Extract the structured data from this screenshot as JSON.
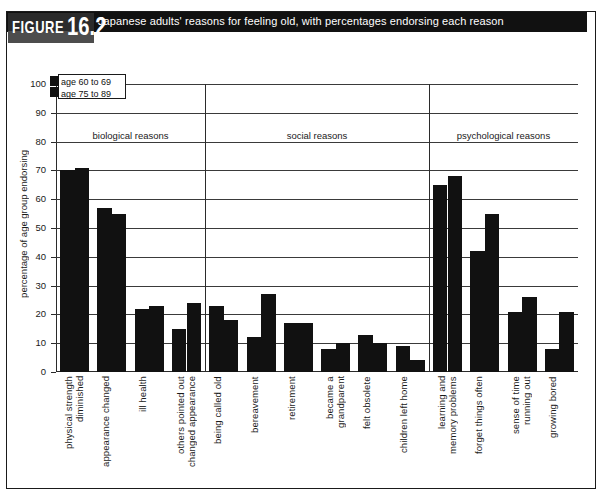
{
  "figure": {
    "tag_word": "FIGURE",
    "number": "16.2",
    "caption": "Japanese adults' reasons for feeling old, with percentages endorsing each reason"
  },
  "legend": {
    "series": [
      {
        "label": "age 60 to 69",
        "color": "#111111"
      },
      {
        "label": "age 75 to 89",
        "color": "#111111"
      }
    ]
  },
  "axes": {
    "y_title": "percentage of age group endorsing",
    "y_ticks": [
      "0",
      "10",
      "20",
      "30",
      "40",
      "50",
      "60",
      "70",
      "80",
      "90",
      "100"
    ]
  },
  "groups": [
    {
      "id": "biological",
      "label": "biological reasons"
    },
    {
      "id": "social",
      "label": "social reasons"
    },
    {
      "id": "psychological",
      "label": "psychological reasons"
    }
  ],
  "chart_data": {
    "type": "bar",
    "title": "Japanese adults' reasons for feeling old, with percentages endorsing each reason",
    "xlabel": "",
    "ylabel": "percentage of age group endorsing",
    "ylim": [
      0,
      100
    ],
    "ytick_step": 10,
    "grid": true,
    "legend_position": "top-left",
    "group_labels": [
      "biological reasons",
      "social reasons",
      "psychological reasons"
    ],
    "categories": [
      "physical strength\ndiminished",
      "appearance changed",
      "ill health",
      "others pointed out\nchanged appearance",
      "being called old",
      "bereavement",
      "retirement",
      "became a\ngrandparent",
      "felt obsolete",
      "children left home",
      "learning and\nmemory problems",
      "forget things often",
      "sense of time\nrunning out",
      "growing bored"
    ],
    "category_groups": [
      "biological",
      "biological",
      "biological",
      "biological",
      "social",
      "social",
      "social",
      "social",
      "social",
      "social",
      "psychological",
      "psychological",
      "psychological",
      "psychological"
    ],
    "series": [
      {
        "name": "age 60 to 69",
        "values": [
          70,
          57,
          22,
          15,
          23,
          12,
          17,
          8,
          13,
          9,
          65,
          42,
          21,
          8
        ]
      },
      {
        "name": "age 75 to 89",
        "values": [
          71,
          55,
          23,
          24,
          18,
          27,
          17,
          10,
          10,
          4,
          68,
          55,
          26,
          21
        ]
      }
    ]
  }
}
